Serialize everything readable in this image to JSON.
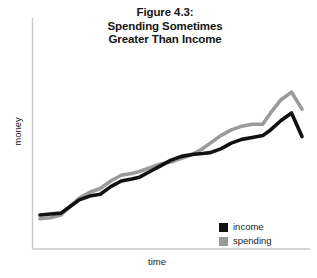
{
  "chart_data": {
    "type": "line",
    "title": "Figure 4.3: Spending Sometimes Greater Than Income",
    "title_lines": [
      "Figure 4.3:",
      "Spending Sometimes",
      "Greater Than Income"
    ],
    "xlabel": "time",
    "ylabel": "money",
    "grid": false,
    "axes_style": "open-L (left and bottom spines only, no ticks, no tick labels)",
    "xlim": [
      0,
      100
    ],
    "ylim": [
      0,
      100
    ],
    "xticks": [],
    "yticks": [],
    "legend_position": "bottom-right inside axes",
    "x": [
      0,
      4,
      8,
      11,
      15,
      19,
      23,
      27,
      31,
      35,
      38,
      42,
      46,
      50,
      54,
      58,
      62,
      65,
      69,
      73,
      77,
      81,
      85,
      88,
      92,
      96,
      100
    ],
    "series": [
      {
        "name": "income",
        "color": "#111111",
        "values": [
          18,
          18.5,
          19,
          22,
          26,
          28,
          29,
          33,
          36,
          37,
          38,
          41,
          44,
          47,
          49,
          50,
          50.5,
          51,
          53,
          56,
          58,
          59,
          60,
          63,
          68,
          72,
          59.5
        ]
      },
      {
        "name": "spending",
        "color": "#9a9a9a",
        "values": [
          16,
          16.5,
          18,
          22,
          27,
          30,
          32,
          36,
          39,
          40,
          41,
          43,
          45,
          46,
          48,
          50,
          53,
          56,
          60,
          63,
          65,
          66,
          66,
          72,
          79,
          83,
          74
        ]
      }
    ],
    "annotations": [
      "spending starts slightly below income",
      "spending rises above income and stays higher through the right side of the chart",
      "both series trend upward over time"
    ]
  },
  "legend": {
    "items": [
      {
        "label": "income",
        "color": "#111111"
      },
      {
        "label": "spending",
        "color": "#9a9a9a"
      }
    ]
  },
  "axes": {
    "line_color": "#c9c9c9",
    "x_label": "time",
    "y_label": "money"
  },
  "colors": {
    "background": "#ffffff",
    "text": "#1a1a1a",
    "income": "#111111",
    "spending": "#9a9a9a",
    "axis": "#c9c9c9"
  }
}
